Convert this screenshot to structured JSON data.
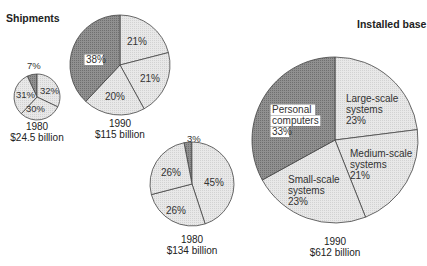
{
  "titles": {
    "shipments": "Shipments",
    "installed": "Installed base"
  },
  "colors": {
    "dark": "#8a8a8a",
    "light": "#e4e4e4",
    "stroke": "#444444"
  },
  "chart_data": [
    {
      "type": "pie",
      "group": "Shipments",
      "title": "1980",
      "subtitle": "$24.5 billion",
      "slices": [
        {
          "label": "Personal computers",
          "value": 7,
          "text": "7%"
        },
        {
          "label": "Large-scale systems",
          "value": 32,
          "text": "32%"
        },
        {
          "label": "Medium-scale systems",
          "value": 30,
          "text": "30%"
        },
        {
          "label": "Small-scale systems",
          "value": 31,
          "text": "31%"
        }
      ]
    },
    {
      "type": "pie",
      "group": "Shipments",
      "title": "1990",
      "subtitle": "$115 billion",
      "slices": [
        {
          "label": "Large-scale systems",
          "value": 21,
          "text": "21%"
        },
        {
          "label": "Medium-scale systems",
          "value": 21,
          "text": "21%"
        },
        {
          "label": "Small-scale systems",
          "value": 20,
          "text": "20%"
        },
        {
          "label": "Personal computers",
          "value": 38,
          "text": "38%"
        }
      ]
    },
    {
      "type": "pie",
      "group": "Installed base",
      "title": "1980",
      "subtitle": "$134 billion",
      "slices": [
        {
          "label": "Personal computers",
          "value": 3,
          "text": "3%"
        },
        {
          "label": "Large-scale systems",
          "value": 45,
          "text": "45%"
        },
        {
          "label": "Medium-scale systems",
          "value": 26,
          "text": "26%"
        },
        {
          "label": "Small-scale systems",
          "value": 26,
          "text": "26%"
        }
      ]
    },
    {
      "type": "pie",
      "group": "Installed base",
      "title": "1990",
      "subtitle": "$612 billion",
      "slices": [
        {
          "label": "Large-scale systems",
          "value": 23,
          "text": "Large-scale systems 23%"
        },
        {
          "label": "Medium-scale systems",
          "value": 21,
          "text": "Medium-scale systems 21%"
        },
        {
          "label": "Small-scale systems",
          "value": 23,
          "text": "Small-scale systems 23%"
        },
        {
          "label": "Personal computers",
          "value": 33,
          "text": "Personal computers 33%"
        }
      ]
    }
  ],
  "captions": {
    "s1980_year": "1980",
    "s1980_val": "$24.5 billion",
    "s1990_year": "1990",
    "s1990_val": "$115 billion",
    "i1980_year": "1980",
    "i1980_val": "$134 billion",
    "i1990_year": "1990",
    "i1990_val": "$612 billion"
  },
  "labels": {
    "s1980": [
      "7%",
      "32%",
      "30%",
      "31%"
    ],
    "s1990": [
      "21%",
      "21%",
      "20%",
      "38%"
    ],
    "i1980": [
      "3%",
      "45%",
      "26%",
      "26%"
    ],
    "i1990": {
      "large": [
        "Large-scale",
        "systems",
        "23%"
      ],
      "medium": [
        "Medium-scale",
        "systems",
        "21%"
      ],
      "small": [
        "Small-scale",
        "systems",
        "23%"
      ],
      "pc": [
        "Personal",
        "computers",
        "33%"
      ]
    }
  }
}
